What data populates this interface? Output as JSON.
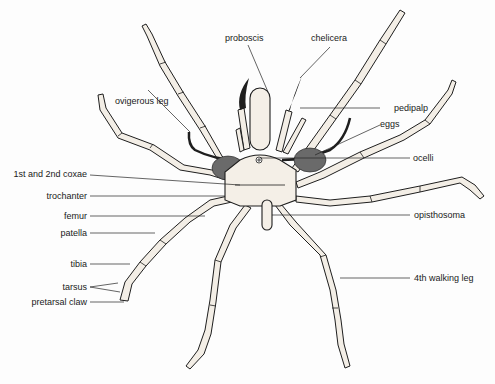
{
  "diagram": {
    "labels": {
      "proboscis": "proboscis",
      "chelicera": "chelicera",
      "pedipalp": "pedipalp",
      "eggs": "eggs",
      "ocelli": "ocelli",
      "ovigerous_leg": "ovigerous leg",
      "coxae": "1st and 2nd coxae",
      "trochanter": "trochanter",
      "femur": "femur",
      "patella": "patella",
      "tibia": "tibia",
      "tarsus": "tarsus",
      "pretarsal_claw": "pretarsal claw",
      "opisthosoma": "opisthosoma",
      "walking_leg_4": "4th walking leg"
    },
    "colors": {
      "line": "#1e1e1e",
      "fill": "#f3eee6",
      "eggs": "#6a6a6a",
      "background": "#fdfdfd"
    }
  }
}
